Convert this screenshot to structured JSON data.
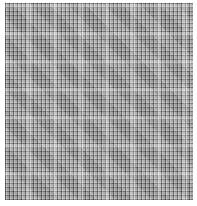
{
  "image": {
    "description": "Grayscale distorted woven grid / mesh texture",
    "colors": {
      "background": "#ffffff",
      "base_gray": "#b4b4b4",
      "dark_line": "#282828",
      "light_line": "#ebebeb"
    }
  }
}
